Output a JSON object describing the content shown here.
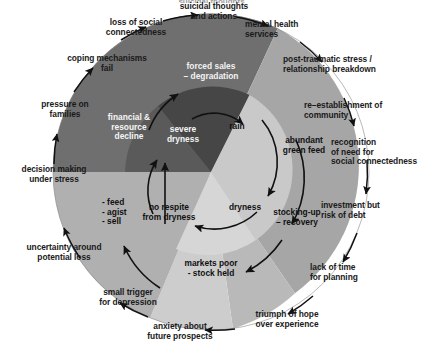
{
  "diagram": {
    "type": "radial-cycle",
    "center": {
      "x": 211,
      "y": 172
    },
    "outer_radius": 158,
    "inner_radius": 86,
    "colors": {
      "background": "#ffffff",
      "sector_dark": "#6e6e6e",
      "sector_darkest": "#4a4a4a",
      "sector_mid": "#9a9a9a",
      "sector_light": "#b3b3b3",
      "sector_lighter": "#c2c2c2",
      "sector_lightest": "#cfcfcf",
      "text": "#1a1a1a",
      "arrow": "#111111"
    },
    "cropped_top_text": "suicidal thoughts"
  },
  "outer_labels": [
    {
      "id": "suicidal-thoughts",
      "text": "suicidal thoughts\nand actions"
    },
    {
      "id": "mental-health-services",
      "text": "mental health\nservices"
    },
    {
      "id": "post-traumatic-stress",
      "text": "post-traumatic stress /\nrelationship breakdown"
    },
    {
      "id": "re-establishment-community",
      "text": "re–establishment of\ncommunity"
    },
    {
      "id": "recognition-of-need",
      "text": "recognition\nof need for\nsocial connectedness"
    },
    {
      "id": "investment-risk-of-debt",
      "text": "investment but\nrisk of debt"
    },
    {
      "id": "lack-of-time-planning",
      "text": "lack of time\nfor planning"
    },
    {
      "id": "triumph-of-hope",
      "text": "triumph of hope\nover experience"
    },
    {
      "id": "anxiety-future-prospects",
      "text": "anxiety about\nfuture prospects"
    },
    {
      "id": "small-trigger-depression",
      "text": "small trigger\nfor depression"
    },
    {
      "id": "uncertainty-potential-loss",
      "text": "uncertainty around\npotential loss"
    },
    {
      "id": "decision-making-stress",
      "text": "decision making\nunder stress"
    },
    {
      "id": "pressure-on-families",
      "text": "pressure on\nfamilies"
    },
    {
      "id": "coping-mechanisms-fail",
      "text": "coping mechanisms\nfail"
    },
    {
      "id": "loss-of-social-connectedness",
      "text": "loss of social\nconnectedness"
    }
  ],
  "inner_labels": [
    {
      "id": "forced-sales-degradation",
      "text": "forced sales\n– degradation"
    },
    {
      "id": "rain",
      "text": "rain"
    },
    {
      "id": "abundant-green-feed",
      "text": "abundant\ngreen feed"
    },
    {
      "id": "stocking-up-recovery",
      "text": "stocking-up\n– recovery"
    },
    {
      "id": "dryness",
      "text": "dryness"
    },
    {
      "id": "markets-poor-stock-held",
      "text": "markets poor\n- stock held"
    },
    {
      "id": "no-respite-from-dryness",
      "text": "no respite\nfrom dryness"
    },
    {
      "id": "feed-agist-sell",
      "text": "- feed\n- agist\n- sell"
    },
    {
      "id": "financial-resource-decline",
      "text": "financial &\nresource\ndecline"
    },
    {
      "id": "severe-dryness",
      "text": "severe\ndryness"
    }
  ]
}
